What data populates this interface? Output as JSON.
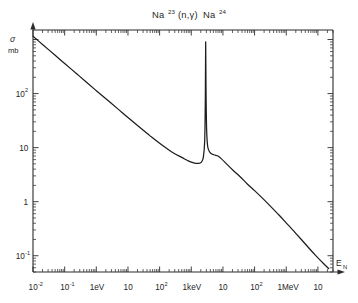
{
  "figure": {
    "title_main_1": "Na",
    "title_sup_1": "23",
    "title_mid": "(n,γ)",
    "title_main_2": "Na",
    "title_sup_2": "24",
    "title_plain": "Na23(n,γ)Na24",
    "y_axis_symbol": "σ",
    "y_axis_unit": "mb",
    "x_axis_symbol": "E",
    "x_axis_subscript": "N",
    "ink_color": "#1d1d1d",
    "background_color": "#ffffff"
  },
  "chart_data": {
    "type": "line",
    "xlabel": "E_N",
    "ylabel": "σ (mb)",
    "xscale": "log",
    "yscale": "log",
    "grid": false,
    "legend": "none",
    "xlim_eV": [
      0.01,
      30000000
    ],
    "ylim_mb": [
      0.05,
      1500
    ],
    "x_tick_labels": [
      {
        "value_eV": 0.01,
        "text": "10",
        "sup": "-2"
      },
      {
        "value_eV": 0.1,
        "text": "10",
        "sup": "-1"
      },
      {
        "value_eV": 1,
        "text": "1eV",
        "sup": ""
      },
      {
        "value_eV": 10,
        "text": "10",
        "sup": ""
      },
      {
        "value_eV": 100,
        "text": "10",
        "sup": "2"
      },
      {
        "value_eV": 1000,
        "text": "1keV",
        "sup": ""
      },
      {
        "value_eV": 10000,
        "text": "10",
        "sup": ""
      },
      {
        "value_eV": 100000,
        "text": "10",
        "sup": "2"
      },
      {
        "value_eV": 1000000,
        "text": "1MeV",
        "sup": ""
      },
      {
        "value_eV": 10000000,
        "text": "10",
        "sup": ""
      }
    ],
    "y_tick_labels": [
      {
        "value_mb": 100,
        "text": "10",
        "sup": "2"
      },
      {
        "value_mb": 10,
        "text": "10",
        "sup": ""
      },
      {
        "value_mb": 1,
        "text": "1",
        "sup": ""
      },
      {
        "value_mb": 0.1,
        "text": "10",
        "sup": "-1"
      }
    ],
    "series": [
      {
        "name": "Na-23 neutron capture cross section",
        "points_eV_mb": [
          [
            0.01,
            1150
          ],
          [
            0.02,
            810
          ],
          [
            0.05,
            510
          ],
          [
            0.1,
            360
          ],
          [
            0.25,
            228
          ],
          [
            0.5,
            160
          ],
          [
            1.0,
            113
          ],
          [
            2.5,
            72
          ],
          [
            5.0,
            51
          ],
          [
            10,
            36
          ],
          [
            25,
            23
          ],
          [
            50,
            16.5
          ],
          [
            100,
            12.0
          ],
          [
            250,
            8.2
          ],
          [
            500,
            6.6
          ],
          [
            800,
            5.7
          ],
          [
            1200,
            5.2
          ],
          [
            1700,
            5.1
          ],
          [
            2100,
            5.4
          ],
          [
            2400,
            6.6
          ],
          [
            2650,
            13
          ],
          [
            2780,
            80
          ],
          [
            2850,
            900
          ],
          [
            2920,
            120
          ],
          [
            3050,
            22
          ],
          [
            3300,
            10.5
          ],
          [
            3800,
            8.3
          ],
          [
            4500,
            7.6
          ],
          [
            5500,
            7.3
          ],
          [
            7000,
            7.0
          ],
          [
            9000,
            6.2
          ],
          [
            13000,
            5.0
          ],
          [
            20000,
            3.9
          ],
          [
            35000,
            2.9
          ],
          [
            60000,
            2.1
          ],
          [
            100000,
            1.6
          ],
          [
            180000,
            1.15
          ],
          [
            320000,
            0.82
          ],
          [
            600000,
            0.56
          ],
          [
            1100000,
            0.38
          ],
          [
            2000000,
            0.26
          ],
          [
            4000000,
            0.165
          ],
          [
            8000000,
            0.105
          ],
          [
            15000000,
            0.072
          ],
          [
            22000000,
            0.058
          ]
        ]
      }
    ],
    "annotations": [
      {
        "text": "resonance peak",
        "x_eV": 2850,
        "y_mb": 900
      }
    ]
  }
}
